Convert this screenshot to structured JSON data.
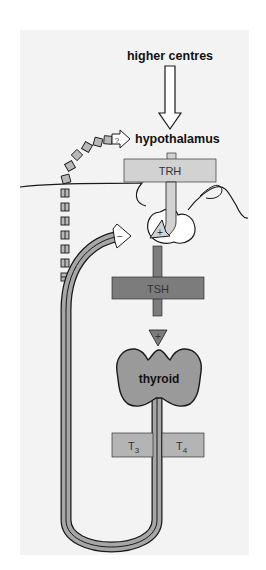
{
  "diagram": {
    "labels": {
      "higher_centres": "higher centres",
      "hypothalamus": "hypothalamus",
      "trh": "TRH",
      "tsh": "TSH",
      "thyroid": "thyroid",
      "t3": "T",
      "t3_sub": "3",
      "t4": "T",
      "t4_sub": "4",
      "question_mark": "?",
      "stimulate_pituitary": "+",
      "stimulate_thyroid": "+",
      "inhibit_feedback": "−"
    },
    "nodes": [
      {
        "id": "higher-centres",
        "label": "higher centres"
      },
      {
        "id": "hypothalamus",
        "label": "hypothalamus"
      },
      {
        "id": "trh",
        "label": "TRH"
      },
      {
        "id": "pituitary",
        "label": ""
      },
      {
        "id": "tsh",
        "label": "TSH"
      },
      {
        "id": "thyroid",
        "label": "thyroid"
      },
      {
        "id": "t3",
        "label": "T3"
      },
      {
        "id": "t4",
        "label": "T4"
      }
    ],
    "edges": [
      {
        "from": "higher-centres",
        "to": "hypothalamus",
        "style": "open-arrow"
      },
      {
        "from": "hypothalamus",
        "to": "pituitary",
        "via": "TRH",
        "sign": "+"
      },
      {
        "from": "pituitary",
        "to": "thyroid",
        "via": "TSH",
        "sign": "+"
      },
      {
        "from": "thyroid",
        "to": "pituitary",
        "via": "T3/T4 feedback loop",
        "sign": "−"
      },
      {
        "from": "thyroid",
        "to": "hypothalamus",
        "via": "dashed feedback",
        "sign": "?"
      }
    ],
    "colors": {
      "panel": "#f3f3f3",
      "trh_box": "#d2d2d2",
      "tsh_box": "#7c7c7c",
      "thyroid": "#9a9a9a",
      "t_box": "#b4b4b4",
      "loop": "#a6a6a6",
      "outline": "#1a1a1a"
    }
  }
}
